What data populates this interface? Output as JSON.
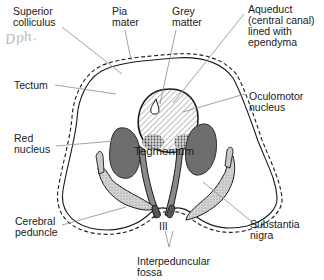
{
  "figure": {
    "labels": {
      "superior_colliculus": "Superior\ncolliculus",
      "pia_mater": "Pia\nmater",
      "grey_matter": "Grey\nmatter",
      "aqueduct": "Aqueduct\n(central canal)\nlined with\nependyma",
      "tectum": "Tectum",
      "oculomotor_nucleus": "Oculomotor\nnucleus",
      "red_nucleus": "Red\nnucleus",
      "tegmentum": "Tegmentum",
      "cerebral_peduncle": "Cerebral\npeduncle",
      "substantia_nigra": "Substantia\nnigra",
      "nerve_iii": "III",
      "interpeduncular_fossa": "Interpeduncular\nfossa"
    },
    "handwriting": "Dph.",
    "colors": {
      "ink": "#1a1a1a",
      "red_nucleus_fill": "#6e6e6e",
      "nigra_fill": "#c9c9c9",
      "leader_line": "#8a8a8a"
    }
  }
}
